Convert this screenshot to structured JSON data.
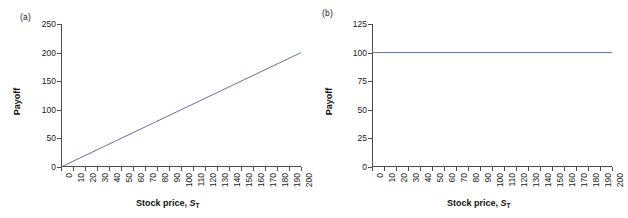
{
  "figure": {
    "panels": [
      {
        "tag": "(a)",
        "ylabel": "Payoff",
        "xlabel_main": "Stock price, ",
        "xlabel_var": "S",
        "xlabel_sub": "T"
      },
      {
        "tag": "(b)",
        "ylabel": "Payoff",
        "xlabel_main": "Stock price, ",
        "xlabel_var": "S",
        "xlabel_sub": "T"
      }
    ]
  },
  "colors": {
    "line": "#6272a4",
    "axis": "#4d4d4d",
    "text": "#1a1a1a",
    "background": "#ffffff"
  },
  "chart_data": [
    {
      "type": "line",
      "title": "(a)",
      "xlabel": "Stock price, S_T",
      "ylabel": "Payoff",
      "xlim": [
        0,
        200
      ],
      "ylim": [
        0,
        250
      ],
      "xticks": [
        0,
        10,
        20,
        30,
        40,
        50,
        60,
        70,
        80,
        90,
        100,
        110,
        120,
        130,
        140,
        150,
        160,
        170,
        180,
        190,
        200
      ],
      "yticks": [
        0,
        50,
        100,
        150,
        200,
        250
      ],
      "grid": false,
      "legend": "none",
      "x": [
        0,
        10,
        20,
        30,
        40,
        50,
        60,
        70,
        80,
        90,
        100,
        110,
        120,
        130,
        140,
        150,
        160,
        170,
        180,
        190,
        200
      ],
      "values": [
        0,
        10,
        20,
        30,
        40,
        50,
        60,
        70,
        80,
        90,
        100,
        110,
        120,
        130,
        140,
        150,
        160,
        170,
        180,
        190,
        200
      ]
    },
    {
      "type": "line",
      "title": "(b)",
      "xlabel": "Stock price, S_T",
      "ylabel": "Payoff",
      "xlim": [
        0,
        200
      ],
      "ylim": [
        0,
        125
      ],
      "xticks": [
        0,
        10,
        20,
        30,
        40,
        50,
        60,
        70,
        80,
        90,
        100,
        110,
        120,
        130,
        140,
        150,
        160,
        170,
        180,
        190,
        200
      ],
      "yticks": [
        0,
        25,
        50,
        75,
        100,
        125
      ],
      "grid": false,
      "legend": "none",
      "x": [
        0,
        10,
        20,
        30,
        40,
        50,
        60,
        70,
        80,
        90,
        100,
        110,
        120,
        130,
        140,
        150,
        160,
        170,
        180,
        190,
        200
      ],
      "values": [
        100,
        100,
        100,
        100,
        100,
        100,
        100,
        100,
        100,
        100,
        100,
        100,
        100,
        100,
        100,
        100,
        100,
        100,
        100,
        100,
        100
      ]
    }
  ]
}
